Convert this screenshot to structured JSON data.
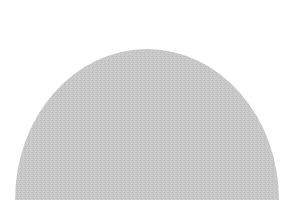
{
  "shape": {
    "type": "half-ellipse",
    "fill": "#c8c8c8",
    "texture_color": "#bdbdbd",
    "center_x": 147,
    "base_y": 200,
    "radius_x": 132,
    "radius_y": 151
  }
}
